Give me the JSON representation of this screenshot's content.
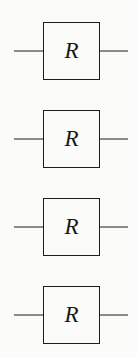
{
  "figure": {
    "kind": "quantum-circuit-gate-diagram",
    "width": 137,
    "height": 357,
    "background_color": "#fbfbfa",
    "ink_color": "#1d1d1d",
    "label_color": "#1a1a1a"
  },
  "geometry": {
    "box_left": 43,
    "box_width": 57,
    "box_height": 58,
    "wire_left_start": 14,
    "wire_left_width": 30,
    "wire_right_start": 99,
    "wire_right_width": 29,
    "stroke_width": 1.5,
    "row_tops": [
      22,
      110,
      198,
      286
    ],
    "wire_centers": [
      52,
      140,
      228,
      315
    ]
  },
  "gates": [
    {
      "index": 1,
      "label": "R",
      "style": "italic-serif",
      "top": 22,
      "wire_center_y": 52,
      "has_left_wire": true,
      "has_right_wire": true
    },
    {
      "index": 2,
      "label": "R",
      "style": "italic-serif",
      "top": 110,
      "wire_center_y": 140,
      "has_left_wire": true,
      "has_right_wire": true
    },
    {
      "index": 3,
      "label": "R",
      "style": "italic-serif",
      "top": 198,
      "wire_center_y": 228,
      "has_left_wire": true,
      "has_right_wire": true
    },
    {
      "index": 4,
      "label": "R",
      "style": "italic-serif",
      "top": 286,
      "wire_center_y": 315,
      "has_left_wire": true,
      "has_right_wire": true
    }
  ]
}
